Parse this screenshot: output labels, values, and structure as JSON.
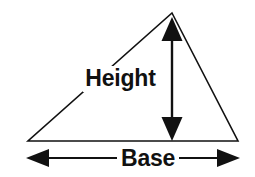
{
  "figure": {
    "background_color": "#ffffff",
    "ink_color": "#111111",
    "width": 255,
    "height": 177
  },
  "labels": {
    "height": "Height",
    "base": "Base"
  },
  "shape": {
    "name": "triangle",
    "type": "scalene-triangle",
    "stroke_color": "#111111",
    "stroke_width": 1.6,
    "fill": "none",
    "vertices": {
      "apex": [
        172,
        13
      ],
      "bottom_left": [
        28,
        141
      ],
      "bottom_right": [
        238,
        141
      ]
    }
  },
  "annotations": {
    "height_arrow": {
      "name": "height-dimension-arrow",
      "orientation": "vertical",
      "double_headed": true,
      "x": 172,
      "y_top": 17,
      "y_bottom": 141,
      "shaft_width": 2.4,
      "head_width": 19,
      "head_length": 23,
      "color": "#111111"
    },
    "base_arrow": {
      "name": "base-dimension-arrow",
      "orientation": "horizontal",
      "double_headed": true,
      "y": 158,
      "x_left": 26,
      "x_right": 240,
      "shaft_width": 2.0,
      "head_width": 17,
      "head_length": 22,
      "color": "#111111"
    }
  }
}
